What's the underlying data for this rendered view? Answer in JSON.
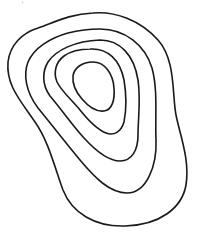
{
  "diagram": {
    "type": "contour-lines",
    "background": "#ffffff",
    "stroke_color": "#1a1a1a",
    "stroke_width": 1.6,
    "contours": [
      {
        "level": 1,
        "path": "M93,13 C115,11 140,20 158,40 C176,60 172,95 176,115 C180,135 190,160 186,185 C182,208 160,225 125,226 C95,227 72,213 63,190 C55,168 48,140 35,122 C20,100 6,85 8,62 C10,45 22,33 38,28 C55,22 70,14 93,13 Z"
      },
      {
        "level": 2,
        "path": "M100,29 C125,29 145,45 152,68 C158,90 155,115 156,140 C157,165 147,193 127,193 C110,193 95,178 80,160 C65,142 52,125 38,108 C26,92 23,75 28,62 C34,48 50,38 68,33 C80,30 90,29 100,29 Z"
      },
      {
        "level": 3,
        "path": "M100,40 C120,40 134,55 138,80 C141,100 138,118 138,135 C138,150 132,161 120,161 C108,161 95,150 84,138 C72,125 62,110 50,96 C42,85 42,72 48,62 C56,50 75,41 100,40 Z"
      },
      {
        "level": 4,
        "path": "M90,49 C108,48 120,60 124,80 C127,98 126,112 124,122 C121,132 114,136 106,133 C96,129 88,120 80,110 C72,100 62,92 57,82 C53,72 56,62 64,56 C71,51 80,49 90,49 Z"
      },
      {
        "level": 5,
        "path": "M93,62 C105,62 113,74 114,88 C115,100 112,110 104,111 C96,112 88,106 82,99 C76,92 72,85 73,76 C74,68 82,62 93,62 Z"
      }
    ],
    "speck": {
      "x": 22,
      "y": 2,
      "color": "#bbbbbb"
    }
  }
}
